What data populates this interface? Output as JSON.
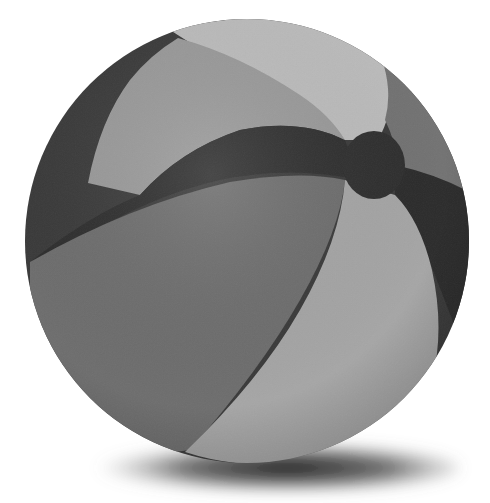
{
  "image": {
    "subject": "beach ball",
    "alt": "Grayscale beach ball with six alternating panels and a dark valve cap, casting a soft shadow",
    "width": 490,
    "height": 503
  },
  "colors": {
    "background": "#ffffff",
    "panel_dark": "#3a3a3a",
    "panel_darker": "#2c2c2c",
    "panel_mid": "#6e6e6e",
    "panel_mid_right": "#737373",
    "panel_light": "#9a9a9a",
    "panel_lightest": "#bdbdbd",
    "panel_lower_light": "#a6a6a6",
    "cap": "#2f2f2f",
    "shadow": "#1a1a1a"
  },
  "ball": {
    "center_x": 247,
    "center_y": 241,
    "radius": 222,
    "panels": [
      "dark-left-rim-band",
      "light-upper-left-panel",
      "lightest-top-panel",
      "mid-upper-right-panel",
      "dark-wavy-center-band",
      "mid-lower-left-panel",
      "light-lower-right-panel",
      "dark-lower-right-rim-band"
    ],
    "cap": {
      "center_x": 374,
      "center_y": 165,
      "radius_x": 31,
      "radius_y": 34
    }
  },
  "shadow": {
    "center_x": 268,
    "center_y": 470,
    "radius_x": 190,
    "radius_y": 24
  }
}
